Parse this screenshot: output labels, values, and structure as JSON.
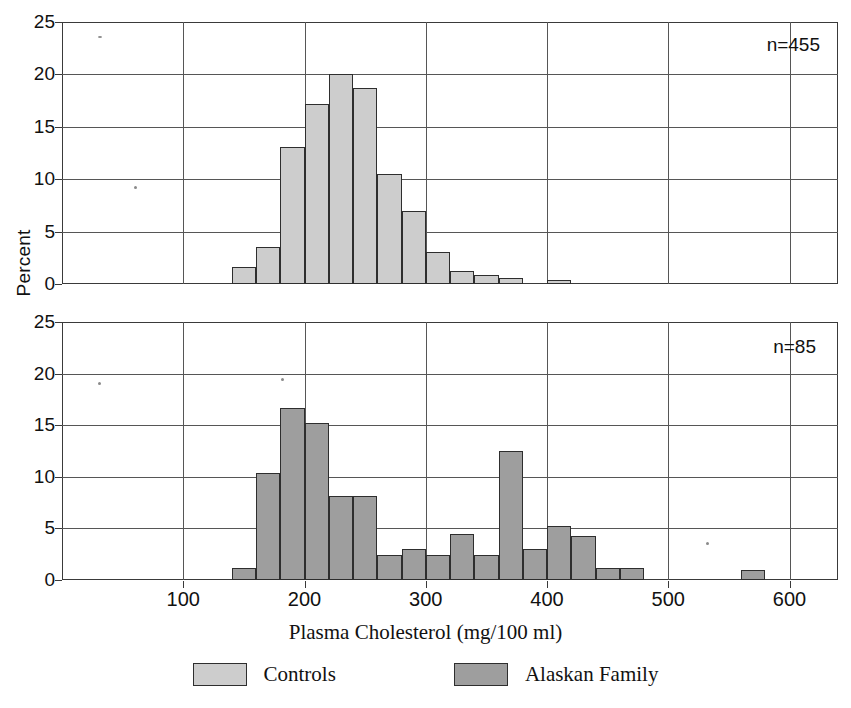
{
  "axes": {
    "ylabel": "Percent",
    "xlabel": "Plasma Cholesterol (mg/100 ml)",
    "y_ticks": [
      "0",
      "5",
      "10",
      "15",
      "20",
      "25"
    ],
    "x_ticks": [
      "100",
      "200",
      "300",
      "400",
      "500",
      "600"
    ]
  },
  "panels": {
    "top": {
      "annotation": "n=455"
    },
    "bottom": {
      "annotation": "n=85"
    }
  },
  "legend": {
    "items": [
      {
        "label": "Controls",
        "color": "#cdcdcd"
      },
      {
        "label": "Alaskan Family",
        "color": "#9e9e9e"
      }
    ]
  },
  "chart_data": [
    {
      "type": "bar",
      "title": "",
      "subtitle": "Controls",
      "annotation": "n=455",
      "n": 455,
      "xlabel": "Plasma Cholesterol (mg/100 ml)",
      "ylabel": "Percent",
      "xlim": [
        0,
        640
      ],
      "ylim": [
        0,
        25
      ],
      "yticks": [
        0,
        5,
        10,
        15,
        20,
        25
      ],
      "xticks": [
        100,
        200,
        300,
        400,
        500,
        600
      ],
      "grid": true,
      "bin_width": 20,
      "series_name": "Controls",
      "color": "#cdcdcd",
      "bin_starts": [
        140,
        160,
        180,
        200,
        220,
        240,
        260,
        280,
        300,
        320,
        340,
        380
      ],
      "values": [
        1.6,
        3.5,
        13.1,
        17.2,
        20.0,
        18.7,
        10.5,
        7.0,
        3.1,
        1.2,
        0.9,
        0.4
      ],
      "bins": [
        {
          "x0": 140,
          "x1": 160,
          "percent": 1.6
        },
        {
          "x0": 160,
          "x1": 180,
          "percent": 3.5
        },
        {
          "x0": 180,
          "x1": 200,
          "percent": 13.1
        },
        {
          "x0": 200,
          "x1": 220,
          "percent": 17.2
        },
        {
          "x0": 220,
          "x1": 240,
          "percent": 20.0
        },
        {
          "x0": 240,
          "x1": 260,
          "percent": 18.7
        },
        {
          "x0": 260,
          "x1": 280,
          "percent": 10.5
        },
        {
          "x0": 280,
          "x1": 300,
          "percent": 7.0
        },
        {
          "x0": 300,
          "x1": 320,
          "percent": 3.1
        },
        {
          "x0": 320,
          "x1": 340,
          "percent": 1.2
        },
        {
          "x0": 340,
          "x1": 360,
          "percent": 0.9
        },
        {
          "x0": 360,
          "x1": 380,
          "percent": 0.6
        },
        {
          "x0": 400,
          "x1": 420,
          "percent": 0.4
        }
      ]
    },
    {
      "type": "bar",
      "title": "",
      "subtitle": "Alaskan Family",
      "annotation": "n=85",
      "n": 85,
      "xlabel": "Plasma Cholesterol (mg/100 ml)",
      "ylabel": "Percent",
      "xlim": [
        0,
        640
      ],
      "ylim": [
        0,
        25
      ],
      "yticks": [
        0,
        5,
        10,
        15,
        20,
        25
      ],
      "xticks": [
        100,
        200,
        300,
        400,
        500,
        600
      ],
      "grid": true,
      "bin_width": 20,
      "series_name": "Alaskan Family",
      "color": "#9e9e9e",
      "bin_starts": [
        140,
        160,
        180,
        200,
        220,
        240,
        260,
        280,
        300,
        320,
        340,
        360,
        380,
        400,
        420,
        440,
        460,
        560
      ],
      "values": [
        1.2,
        10.4,
        16.7,
        15.2,
        8.1,
        8.1,
        2.4,
        3.0,
        2.4,
        4.5,
        2.4,
        12.5,
        3.0,
        5.2,
        4.3,
        1.2,
        1.2,
        1.0
      ],
      "bins": [
        {
          "x0": 140,
          "x1": 160,
          "percent": 1.2
        },
        {
          "x0": 160,
          "x1": 180,
          "percent": 10.4
        },
        {
          "x0": 180,
          "x1": 200,
          "percent": 16.7
        },
        {
          "x0": 200,
          "x1": 220,
          "percent": 15.2
        },
        {
          "x0": 220,
          "x1": 240,
          "percent": 8.1
        },
        {
          "x0": 240,
          "x1": 260,
          "percent": 8.1
        },
        {
          "x0": 260,
          "x1": 280,
          "percent": 2.4
        },
        {
          "x0": 280,
          "x1": 300,
          "percent": 3.0
        },
        {
          "x0": 300,
          "x1": 320,
          "percent": 2.4
        },
        {
          "x0": 320,
          "x1": 340,
          "percent": 4.5
        },
        {
          "x0": 340,
          "x1": 360,
          "percent": 2.4
        },
        {
          "x0": 360,
          "x1": 380,
          "percent": 12.5
        },
        {
          "x0": 380,
          "x1": 400,
          "percent": 3.0
        },
        {
          "x0": 400,
          "x1": 420,
          "percent": 5.2
        },
        {
          "x0": 420,
          "x1": 440,
          "percent": 4.3
        },
        {
          "x0": 440,
          "x1": 460,
          "percent": 1.2
        },
        {
          "x0": 460,
          "x1": 480,
          "percent": 1.2
        },
        {
          "x0": 560,
          "x1": 580,
          "percent": 1.0
        }
      ]
    }
  ]
}
